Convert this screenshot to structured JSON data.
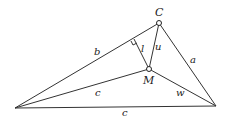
{
  "diagram": {
    "type": "triangle-geometry",
    "vertices": {
      "A": {
        "x": 15,
        "y": 108,
        "label": ""
      },
      "B": {
        "x": 216,
        "y": 106,
        "label": ""
      },
      "C": {
        "x": 159,
        "y": 23,
        "label": "C"
      }
    },
    "interior_point": {
      "x": 149,
      "y": 69,
      "label": "M"
    },
    "perpendicular_foot": {
      "x": 134,
      "y": 39
    },
    "labels": {
      "side_AC": "b",
      "side_BC": "a",
      "side_AB": "c",
      "segment_AM": "c",
      "segment_BM": "w",
      "segment_CM": "u",
      "perpendicular": "l",
      "vertex_C": "C",
      "point_M": "M"
    },
    "colors": {
      "line": "#333333",
      "text": "#222222",
      "background": "#ffffff"
    }
  }
}
